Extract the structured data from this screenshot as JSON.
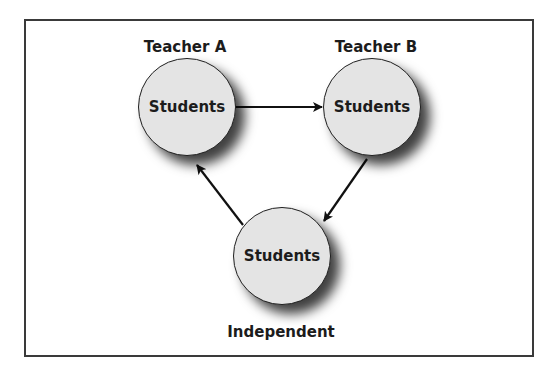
{
  "diagram": {
    "type": "cycle",
    "nodes": [
      {
        "id": "teacher-a",
        "label": "Teacher A",
        "text": "Students",
        "cx": 187,
        "cy": 107
      },
      {
        "id": "teacher-b",
        "label": "Teacher B",
        "text": "Students",
        "cx": 372,
        "cy": 107
      },
      {
        "id": "independent",
        "label": "Independent",
        "text": "Students",
        "cx": 282,
        "cy": 255
      }
    ],
    "edges": [
      {
        "from": "teacher-a",
        "to": "teacher-b"
      },
      {
        "from": "teacher-b",
        "to": "independent"
      },
      {
        "from": "independent",
        "to": "teacher-a"
      }
    ],
    "colors": {
      "node_fill": "#e4e4e4",
      "stroke": "#1f1f1f",
      "frame": "#3a3a3a"
    }
  }
}
